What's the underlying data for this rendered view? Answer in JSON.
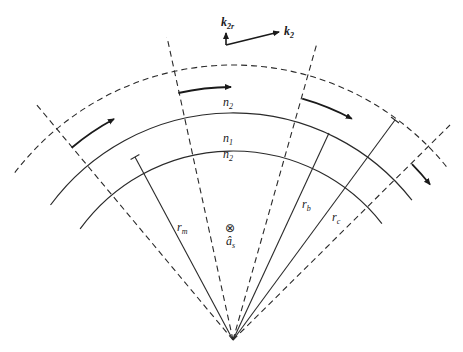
{
  "diagram": {
    "vectors": {
      "k2r": {
        "base": "k",
        "sub": "2r"
      },
      "k2": {
        "base": "k",
        "sub": "2"
      }
    },
    "regions": {
      "outer_cladding": {
        "base": "n",
        "sub": "2"
      },
      "core": {
        "base": "n",
        "sub": "1"
      },
      "inner_cladding": {
        "base": "n",
        "sub": "2"
      }
    },
    "radii": {
      "rm": {
        "base": "r",
        "sub": "m"
      },
      "rb": {
        "base": "r",
        "sub": "b"
      },
      "rc": {
        "base": "r",
        "sub": "c"
      }
    },
    "axis": {
      "symbol": "⊗",
      "base": "â",
      "sub": "s"
    }
  }
}
